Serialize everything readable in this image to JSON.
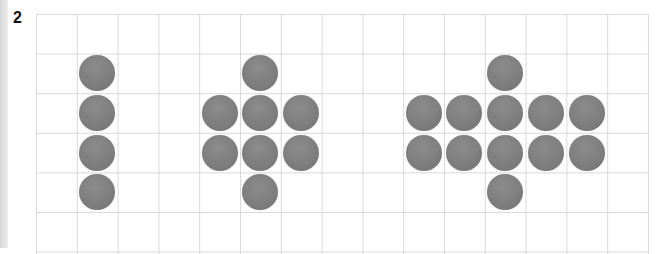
{
  "problem": {
    "number": "2"
  },
  "grid": {
    "columns": 15,
    "rows": 6,
    "cell_w": 40.8,
    "cell_h": 39.6,
    "line_color": "#d9d9d9"
  },
  "dot_color": "#808080",
  "groups": [
    {
      "name": "vertical-line",
      "count": 4,
      "dots": [
        [
          1,
          1
        ],
        [
          1,
          2
        ],
        [
          1,
          3
        ],
        [
          1,
          4
        ]
      ]
    },
    {
      "name": "cross-3-wide",
      "count": 8,
      "dots": [
        [
          5,
          1
        ],
        [
          4,
          2
        ],
        [
          5,
          2
        ],
        [
          6,
          2
        ],
        [
          4,
          3
        ],
        [
          5,
          3
        ],
        [
          6,
          3
        ],
        [
          5,
          4
        ]
      ]
    },
    {
      "name": "cross-5-wide",
      "count": 12,
      "dots": [
        [
          11,
          1
        ],
        [
          9,
          2
        ],
        [
          10,
          2
        ],
        [
          11,
          2
        ],
        [
          12,
          2
        ],
        [
          13,
          2
        ],
        [
          9,
          3
        ],
        [
          10,
          3
        ],
        [
          11,
          3
        ],
        [
          12,
          3
        ],
        [
          13,
          3
        ],
        [
          11,
          4
        ]
      ]
    }
  ]
}
